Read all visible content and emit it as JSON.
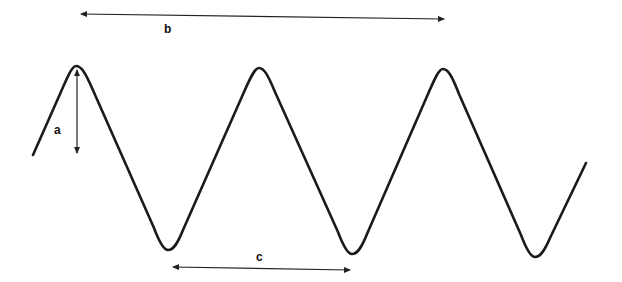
{
  "diagram": {
    "title": "",
    "type": "wave-dimension-diagram",
    "colors": {
      "background": "#ffffff",
      "wave": "#1a1a1a",
      "dimension_lines": "#222222",
      "labels": "#111111"
    },
    "wave": {
      "description": "Periodic wave with 3 crests and 3 troughs",
      "crests": [
        {
          "x": 76,
          "y": 66
        },
        {
          "x": 259,
          "y": 68
        },
        {
          "x": 443,
          "y": 69
        }
      ],
      "troughs": [
        {
          "x": 168,
          "y": 250
        },
        {
          "x": 352,
          "y": 254
        },
        {
          "x": 535,
          "y": 257
        }
      ],
      "start": {
        "x": 33,
        "y": 155
      },
      "end": {
        "x": 586,
        "y": 163
      }
    },
    "dimensions": [
      {
        "id": "a",
        "label": "a",
        "orientation": "vertical",
        "meaning": "amplitude (crest to rest line)",
        "from": {
          "x": 77,
          "y": 68
        },
        "to": {
          "x": 77,
          "y": 153
        },
        "label_pos": {
          "x": 54,
          "y": 127
        }
      },
      {
        "id": "b",
        "label": "b",
        "orientation": "horizontal",
        "meaning": "span across crests",
        "from": {
          "x": 81,
          "y": 14
        },
        "to": {
          "x": 444,
          "y": 19
        },
        "label_pos": {
          "x": 164,
          "y": 25
        }
      },
      {
        "id": "c",
        "label": "c",
        "orientation": "horizontal",
        "meaning": "distance trough to trough (wavelength)",
        "from": {
          "x": 173,
          "y": 267
        },
        "to": {
          "x": 350,
          "y": 270
        },
        "label_pos": {
          "x": 256,
          "y": 252
        }
      }
    ]
  }
}
